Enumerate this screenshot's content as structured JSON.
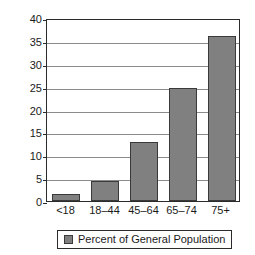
{
  "chart_data": {
    "type": "bar",
    "title": "",
    "subtitle": "",
    "xlabel": "",
    "ylabel": "",
    "categories": [
      "<18",
      "18–44",
      "45–64",
      "65–74",
      "75+"
    ],
    "values": [
      1.5,
      4.3,
      13,
      24.8,
      36
    ],
    "series": [
      {
        "name": "Percent of General Population",
        "values": [
          1.5,
          4.3,
          13,
          24.8,
          36
        ],
        "color": "#808080"
      }
    ],
    "ylim": [
      0,
      40
    ],
    "y_ticks": [
      0,
      5,
      10,
      15,
      20,
      25,
      30,
      35,
      40
    ],
    "y_tick_labels": [
      "0",
      "5",
      "10",
      "15",
      "20",
      "25",
      "30",
      "35",
      "40"
    ],
    "grid": true,
    "grid_axis": "y",
    "legend": {
      "position": "bottom",
      "entries": [
        {
          "label": "Percent of General Population",
          "color": "#808080",
          "swatch": "legend-swatch-icon"
        }
      ]
    },
    "colors": {
      "bar_fill": "#808080",
      "bar_stroke": "#3a3a3a",
      "axis": "#2b2b2b",
      "gridline": "#8c8c8c",
      "text": "#1a1a1a",
      "background": "#ffffff"
    }
  }
}
